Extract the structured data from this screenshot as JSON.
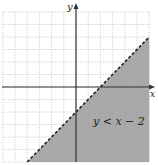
{
  "chart_data": {
    "type": "area",
    "title": "",
    "inequality": "y < x − 2",
    "boundary_line": {
      "equation": "y = x - 2",
      "slope": 1,
      "intercept": -2,
      "style": "dashed"
    },
    "shaded_region": "below line",
    "xlabel": "x",
    "ylabel": "y",
    "xlim": [
      -6,
      6
    ],
    "ylim": [
      -6,
      6
    ],
    "grid": true,
    "colors": {
      "shade": "#9a9a9a",
      "grid": "#b0b0b0",
      "axis": "#333333",
      "line": "#222222"
    }
  },
  "labels": {
    "x_axis": "x",
    "y_axis": "y",
    "inequality": "y < x − 2"
  }
}
